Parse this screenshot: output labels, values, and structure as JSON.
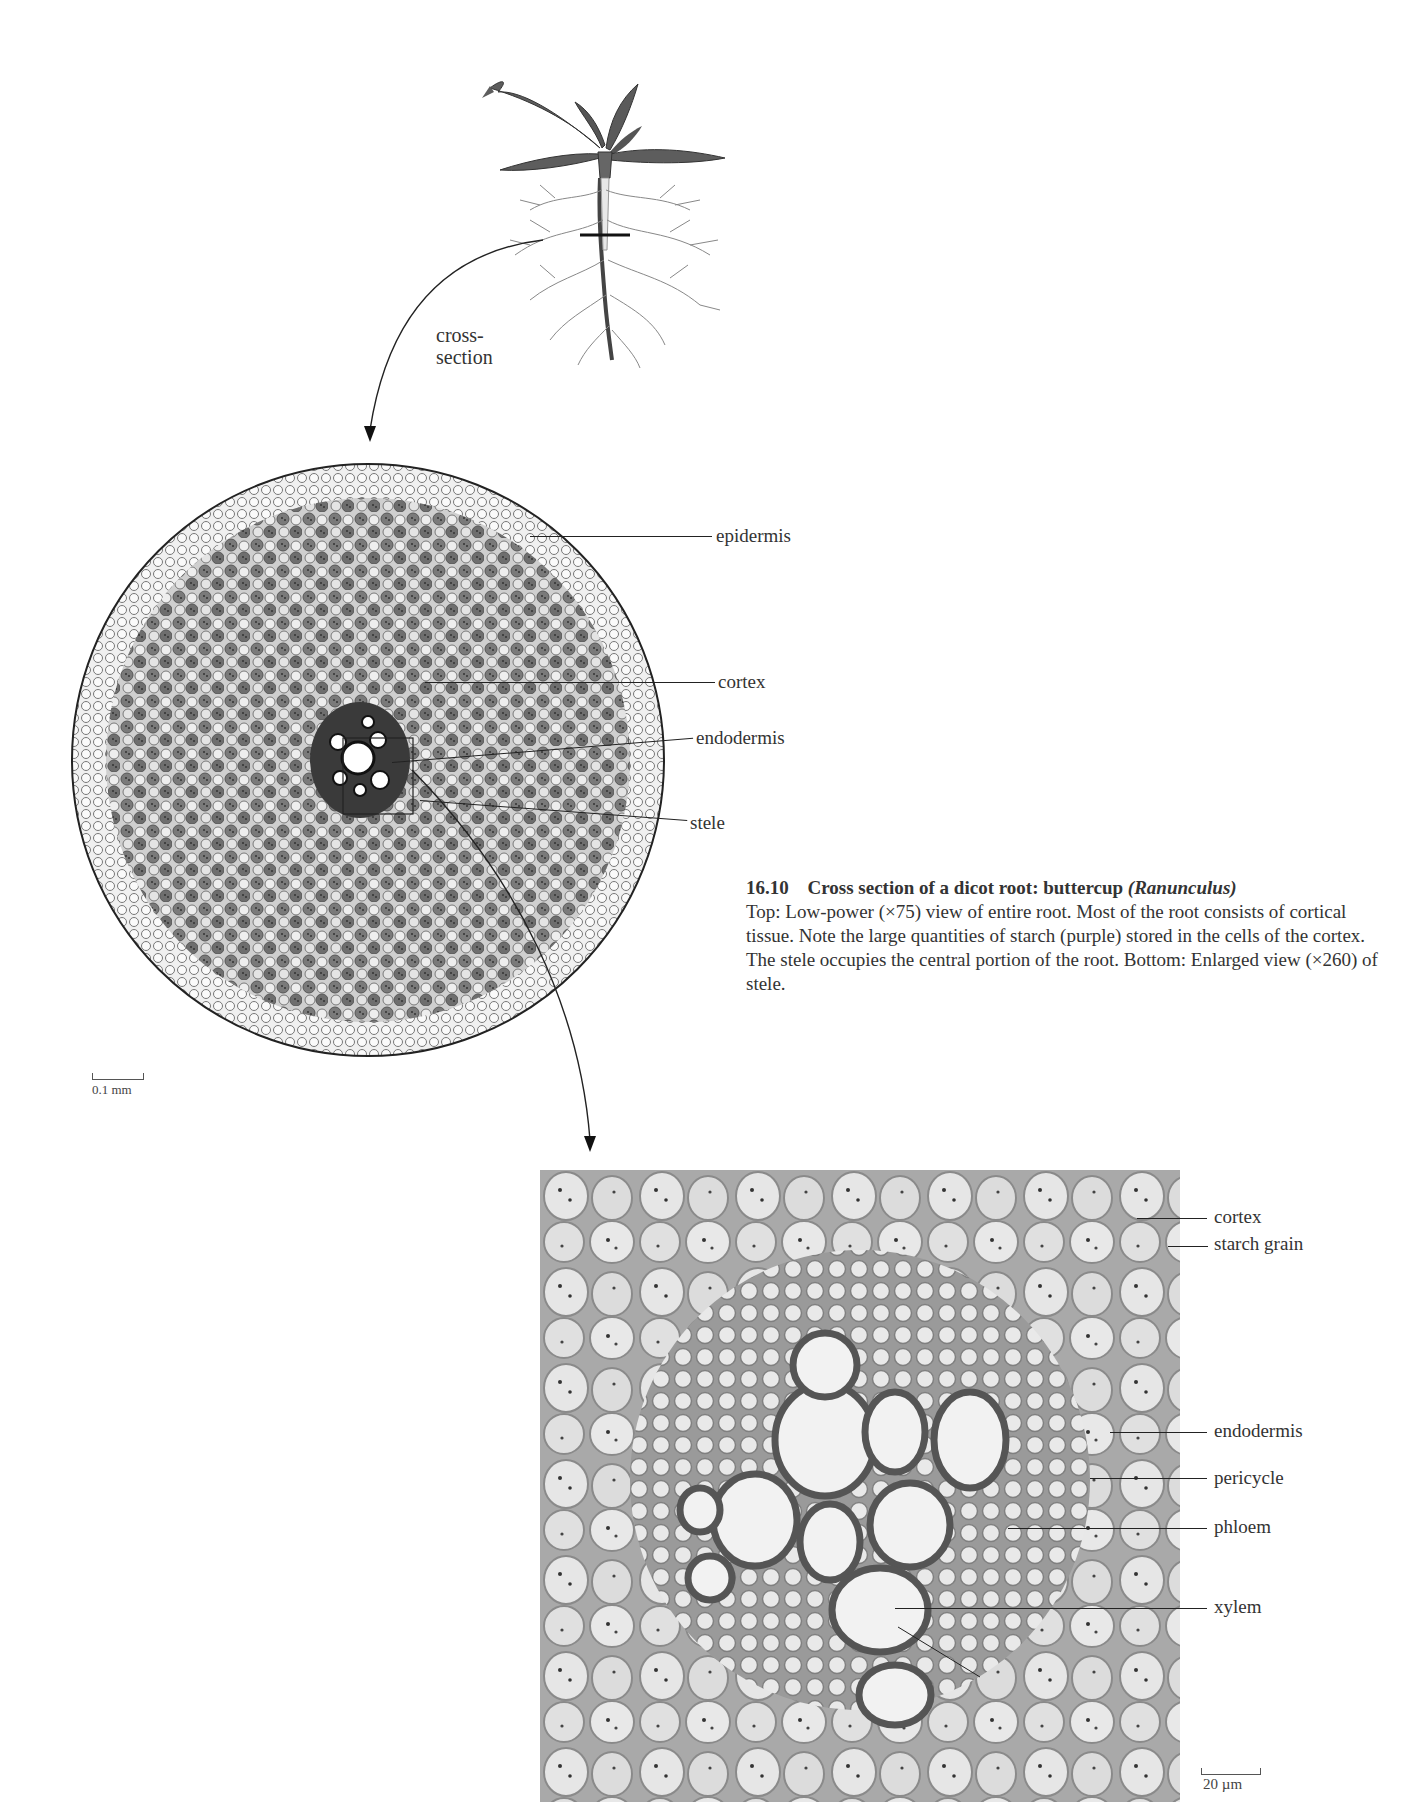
{
  "figure": {
    "number": "16.10",
    "title": "Cross section of a dicot root: buttercup",
    "title_italic": "(Ranunculus)",
    "caption_body": "Top: Low-power (×75) view of entire root. Most of the root consists of cortical tissue. Note the large quantities of starch (purple) stored in the cells of the cortex. The stele occupies the central portion of the root. Bottom: Enlarged view (×260) of stele."
  },
  "plant_illustration": {
    "callout_line1": "cross-",
    "callout_line2": "section"
  },
  "top_micrograph": {
    "labels": {
      "epidermis": "epidermis",
      "cortex": "cortex",
      "endodermis": "endodermis",
      "stele": "stele"
    },
    "scale_bar": "0.1 mm"
  },
  "bottom_micrograph": {
    "labels": {
      "cortex": "cortex",
      "starch_grain": "starch grain",
      "endodermis": "endodermis",
      "pericycle": "pericycle",
      "phloem": "phloem",
      "xylem": "xylem"
    },
    "scale_bar": "20 µm"
  },
  "colors": {
    "tissue_wall": "#6e6e6e",
    "cell_fill": "#ececec",
    "starch": "#3a3a3a",
    "leaf": "#5a5a5a",
    "text": "#333333"
  }
}
